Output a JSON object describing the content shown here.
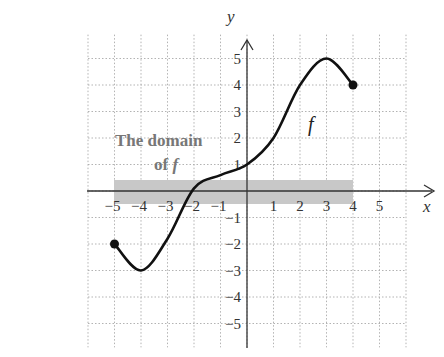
{
  "chart_data": {
    "type": "line",
    "title": "",
    "xlabel": "x",
    "ylabel": "y",
    "xlim": [
      -6,
      6
    ],
    "ylim": [
      -6,
      6
    ],
    "grid": true,
    "x_ticks": [
      "-5",
      "-4",
      "-3",
      "-2",
      "-1",
      "1",
      "2",
      "3",
      "4",
      "5"
    ],
    "y_ticks": [
      "5",
      "4",
      "3",
      "2",
      "1",
      "-1",
      "-2",
      "-3",
      "-4",
      "-5"
    ],
    "series": [
      {
        "name": "f",
        "x": [
          -5,
          -4,
          -3,
          -2,
          -1,
          0,
          1,
          2,
          3,
          4
        ],
        "y": [
          -2,
          -3,
          -1.8,
          0.1,
          0.6,
          1,
          2,
          4,
          5,
          4
        ],
        "endpoints": [
          {
            "x": -5,
            "y": -2,
            "closed": true
          },
          {
            "x": 4,
            "y": 4,
            "closed": true
          }
        ]
      }
    ],
    "annotations": [
      {
        "text": "The domain",
        "line": 1
      },
      {
        "text": "of",
        "italic_suffix": "f",
        "line": 2
      },
      {
        "text": "f",
        "label_for": "curve"
      }
    ],
    "shaded_interval": {
      "axis": "x",
      "from": -5,
      "to": 4,
      "label": "The domain of f"
    }
  },
  "labels": {
    "x_axis": "x",
    "y_axis": "y",
    "anno_line1": "The domain",
    "anno_line2_prefix": "of ",
    "anno_line2_italic": "f",
    "curve_label": "f"
  }
}
